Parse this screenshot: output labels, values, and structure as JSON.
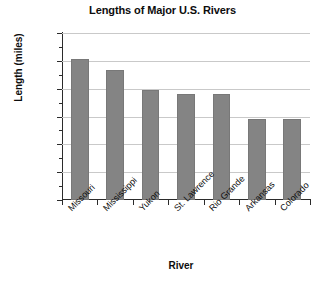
{
  "chart_data": {
    "type": "bar",
    "title": "Lengths of Major U.S. Rivers",
    "xlabel": "River",
    "ylabel": "Length (miles)",
    "categories": [
      "Missouri",
      "Mississippi",
      "Yukon",
      "St. Lawrence",
      "Rio Grande",
      "Arkansas",
      "Colorado"
    ],
    "values": [
      2540,
      2340,
      1980,
      1900,
      1900,
      1460,
      1450
    ],
    "ylim": [
      0,
      3000
    ],
    "yticks": [
      0,
      500,
      1000,
      1500,
      2000,
      2500,
      3000
    ],
    "ytick_labels": [
      "0",
      "500",
      "1,000",
      "1,500",
      "2,000",
      "2,500",
      "3,000"
    ],
    "minor_tick_step": 250,
    "grid": true,
    "legend": false,
    "bar_color": "#848484",
    "grid_color": "#c9c9c9",
    "axis_color": "#2b2b2b",
    "background": "#ffffff"
  }
}
